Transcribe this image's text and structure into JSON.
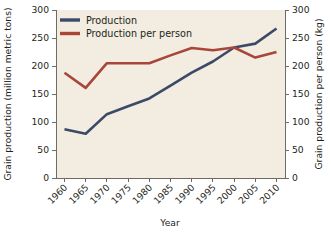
{
  "chart_data": {
    "type": "line",
    "title": "",
    "xlabel": "Year",
    "ylabel": "Grain production (million metric tons)",
    "ylabel_right": "Grain production per person (kg)",
    "x": [
      1960,
      1965,
      1970,
      1975,
      1980,
      1985,
      1990,
      1995,
      2000,
      2005,
      2010
    ],
    "xlim": [
      1958,
      2012
    ],
    "xticks": [
      1960,
      1965,
      1970,
      1975,
      1980,
      1985,
      1990,
      1995,
      2000,
      2005,
      2010
    ],
    "xtick_labels": [
      "1960",
      "1965",
      "1970",
      "1975",
      "1980",
      "1985",
      "1990",
      "1995",
      "2000",
      "2005",
      "2010"
    ],
    "ylim": [
      0,
      300
    ],
    "yticks": [
      0,
      50,
      100,
      150,
      200,
      250,
      300
    ],
    "ytick_labels": [
      "0",
      "50",
      "100",
      "150",
      "200",
      "250",
      "300"
    ],
    "ylim_right": [
      0,
      300
    ],
    "yticks_right": [
      0,
      50,
      100,
      150,
      200,
      250,
      300
    ],
    "ytick_labels_right": [
      "0",
      "50",
      "100",
      "150",
      "200",
      "250",
      "300"
    ],
    "grid": false,
    "legend_position": "upper left",
    "plot_background": "#f2ece1",
    "series": [
      {
        "name": "Production",
        "axis": "left",
        "color": "#3c4a68",
        "values": [
          87,
          79,
          114,
          128,
          142,
          165,
          188,
          208,
          233,
          240,
          267
        ]
      },
      {
        "name": "Production per person",
        "axis": "right",
        "color": "#a9463a",
        "values": [
          188,
          161,
          205,
          205,
          205,
          219,
          232,
          228,
          233,
          215,
          225
        ]
      }
    ]
  },
  "legend": {
    "entries": [
      {
        "label": "Production",
        "color": "#3c4a68"
      },
      {
        "label": "Production per person",
        "color": "#a9463a"
      }
    ]
  }
}
